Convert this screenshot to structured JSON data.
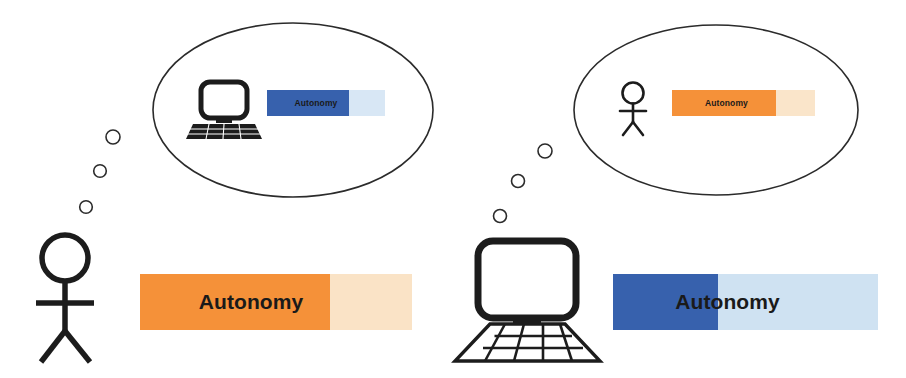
{
  "canvas": {
    "width": 906,
    "height": 378,
    "background": "#ffffff"
  },
  "palette": {
    "orange_fill": "#F59139",
    "orange_track": "#FAE3C6",
    "blue_fill": "#3761AD",
    "blue_track": "#CFE2F2",
    "blue_track_light": "#D8E7F5",
    "orange_track_light": "#FAE5CA",
    "outline": "#2b2b2b",
    "label_text": "#1a1a1a"
  },
  "scene": {
    "left_actor": {
      "icon": "stick-figure-person-icon",
      "bar": {
        "label": "Autonomy",
        "fill_fraction": 0.7,
        "fill_color": "#F59139",
        "track_color": "#FAE3C6"
      },
      "thought_bubble": {
        "icon": "desktop-computer-icon",
        "bar": {
          "label": "Autonomy",
          "fill_fraction": 0.69,
          "fill_color": "#3761AD",
          "track_color": "#D8E7F5"
        }
      }
    },
    "right_actor": {
      "icon": "desktop-computer-icon",
      "bar": {
        "label": "Autonomy",
        "fill_fraction": 0.4,
        "fill_color": "#3761AD",
        "track_color": "#CFE2F2"
      },
      "thought_bubble": {
        "icon": "stick-figure-person-icon",
        "bar": {
          "label": "Autonomy",
          "fill_fraction": 0.73,
          "fill_color": "#F59139",
          "track_color": "#FAE5CA"
        }
      }
    }
  }
}
